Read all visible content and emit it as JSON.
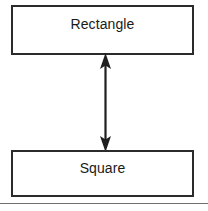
{
  "diagram": {
    "type": "two-node-bidirectional-relationship",
    "background_color": "#ffffff",
    "stroke_color": "#2b2b2b",
    "text_color": "#1a1a1a",
    "nodes": [
      {
        "id": "rectangle",
        "label": "Rectangle",
        "shape": "box"
      },
      {
        "id": "square",
        "label": "Square",
        "shape": "box"
      }
    ],
    "connector": {
      "name": "double-headed-arrow",
      "orientation": "vertical",
      "from": "Rectangle",
      "to": "Square",
      "arrowheads": "both"
    },
    "footer_rule": {
      "name": "horizontal-rule",
      "color": "#6e6e6e"
    }
  }
}
